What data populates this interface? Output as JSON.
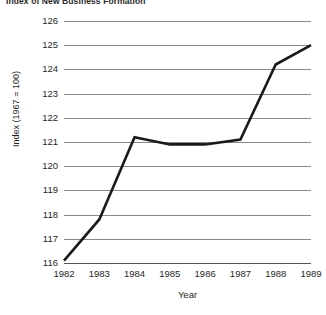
{
  "chart_data": {
    "type": "line",
    "title": "Index of New Business Formation",
    "xlabel": "Year",
    "ylabel": "Index (1967 = 100)",
    "categories": [
      "1982",
      "1983",
      "1984",
      "1985",
      "1986",
      "1987",
      "1988",
      "1989"
    ],
    "x": [
      1982,
      1983,
      1984,
      1985,
      1986,
      1987,
      1988,
      1989
    ],
    "values": [
      116.1,
      117.8,
      121.2,
      120.9,
      120.9,
      121.1,
      124.2,
      125.0
    ],
    "series": [
      {
        "name": "Index (1967 = 100)",
        "values": [
          116.1,
          117.8,
          121.2,
          120.9,
          120.9,
          121.1,
          124.2,
          125.0
        ]
      }
    ],
    "ylim": [
      116,
      126
    ],
    "xlim": [
      1982,
      1989
    ],
    "yticks": [
      116,
      117,
      118,
      119,
      120,
      121,
      122,
      123,
      124,
      125,
      126
    ],
    "ytick_labels": [
      "116",
      "117",
      "118",
      "119",
      "120",
      "121",
      "122",
      "123",
      "124",
      "125",
      "126"
    ],
    "xtick_labels": [
      "1982",
      "1983",
      "1984",
      "1985",
      "1986",
      "1987",
      "1988",
      "1989"
    ],
    "grid": "horizontal",
    "legend": "none",
    "line_color": "#1a1a1a",
    "grid_color": "#8a8a8a",
    "background_color": "#ffffff"
  }
}
